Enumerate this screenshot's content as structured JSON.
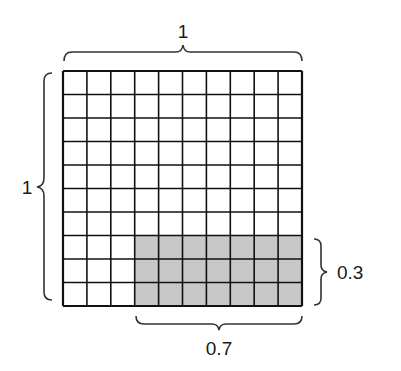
{
  "diagram": {
    "grid": {
      "rows": 10,
      "cols": 10,
      "x": 63,
      "y": 71,
      "width": 239,
      "height": 235,
      "shaded": {
        "col_start": 3,
        "col_end": 10,
        "row_start": 7,
        "row_end": 10
      },
      "shade_color": "#c8c8c8",
      "line_color": "#111111"
    },
    "labels": {
      "top": "1",
      "left": "1",
      "right": "0.3",
      "bottom": "0.7"
    }
  }
}
